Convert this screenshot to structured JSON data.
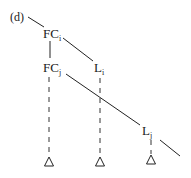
{
  "diagram": {
    "panel_label": "(d)",
    "nodes": {
      "fci": {
        "base": "FC",
        "sub": "i"
      },
      "fcj": {
        "base": "FC",
        "sub": "j"
      },
      "li": {
        "base": "L",
        "sub": "i"
      },
      "lj": {
        "base": "L",
        "sub": "j"
      }
    },
    "edges": [
      {
        "from": "(d)",
        "to": "FCi",
        "style": "solid"
      },
      {
        "from": "FCi",
        "to": "FCj",
        "style": "solid"
      },
      {
        "from": "FCi",
        "to": "Li",
        "style": "solid"
      },
      {
        "from": "FCj",
        "to": "Lj",
        "style": "solid"
      },
      {
        "from": "Lj",
        "to": "off-right",
        "style": "solid"
      },
      {
        "from": "FCj",
        "to": "triangle-1",
        "style": "dashed"
      },
      {
        "from": "Li",
        "to": "triangle-2",
        "style": "dashed"
      },
      {
        "from": "Lj",
        "to": "triangle-3",
        "style": "dashed"
      }
    ],
    "triangles": 3
  }
}
